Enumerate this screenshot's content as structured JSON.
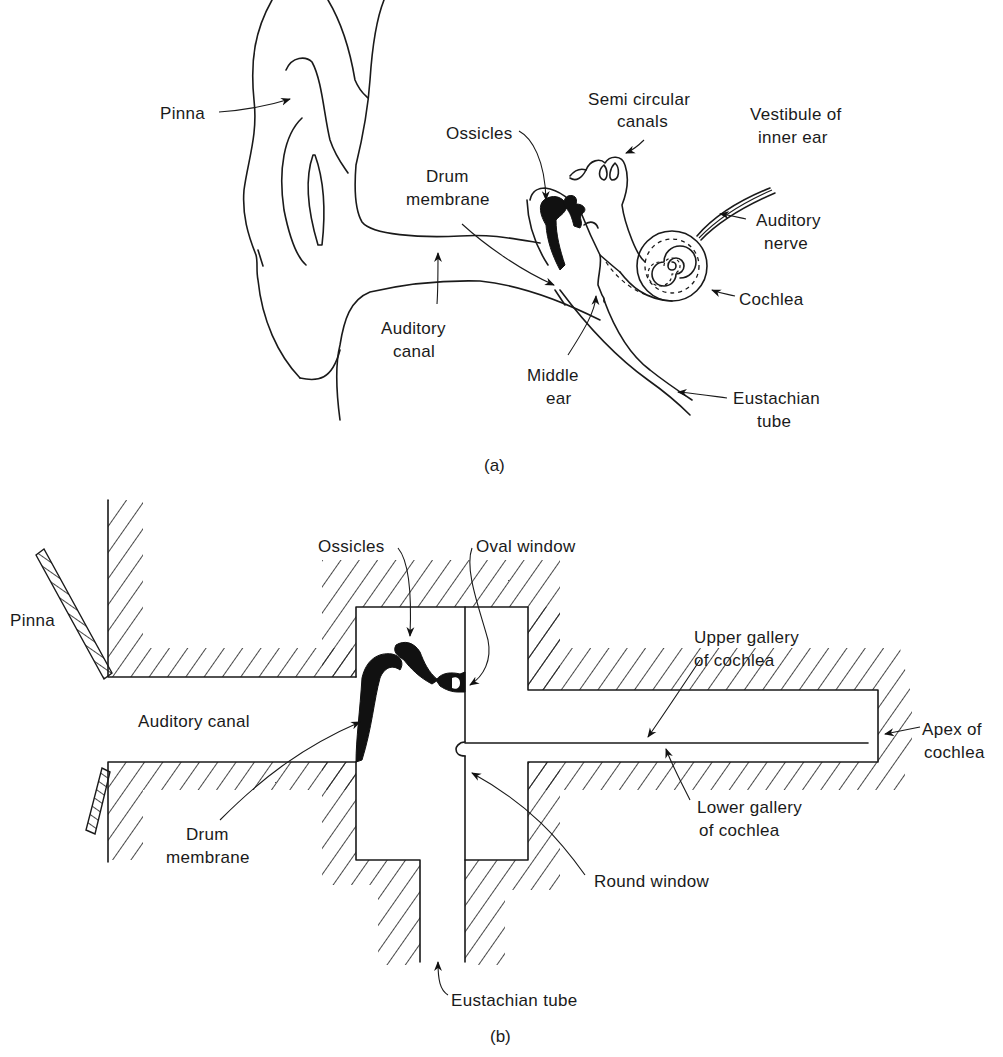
{
  "figure_a": {
    "caption": "(a)",
    "labels": {
      "pinna": "Pinna",
      "ossicles": "Ossicles",
      "semi_circular_1": "Semi circular",
      "semi_circular_2": "canals",
      "vestibule_1": "Vestibule of",
      "vestibule_2": "inner ear",
      "drum_1": "Drum",
      "drum_2": "membrane",
      "auditory_nerve_1": "Auditory",
      "auditory_nerve_2": "nerve",
      "cochlea": "Cochlea",
      "auditory_canal_1": "Auditory",
      "auditory_canal_2": "canal",
      "middle_ear_1": "Middle",
      "middle_ear_2": "ear",
      "eustachian_1": "Eustachian",
      "eustachian_2": "tube"
    }
  },
  "figure_b": {
    "caption": "(b)",
    "labels": {
      "pinna": "Pinna",
      "ossicles": "Ossicles",
      "oval_window": "Oval window",
      "upper_gallery_1": "Upper gallery",
      "upper_gallery_2": "of cochlea",
      "auditory_canal": "Auditory canal",
      "apex_1": "Apex of",
      "apex_2": "cochlea",
      "drum_1": "Drum",
      "drum_2": "membrane",
      "lower_gallery_1": "Lower gallery",
      "lower_gallery_2": "of cochlea",
      "round_window": "Round window",
      "eustachian": "Eustachian tube"
    }
  }
}
